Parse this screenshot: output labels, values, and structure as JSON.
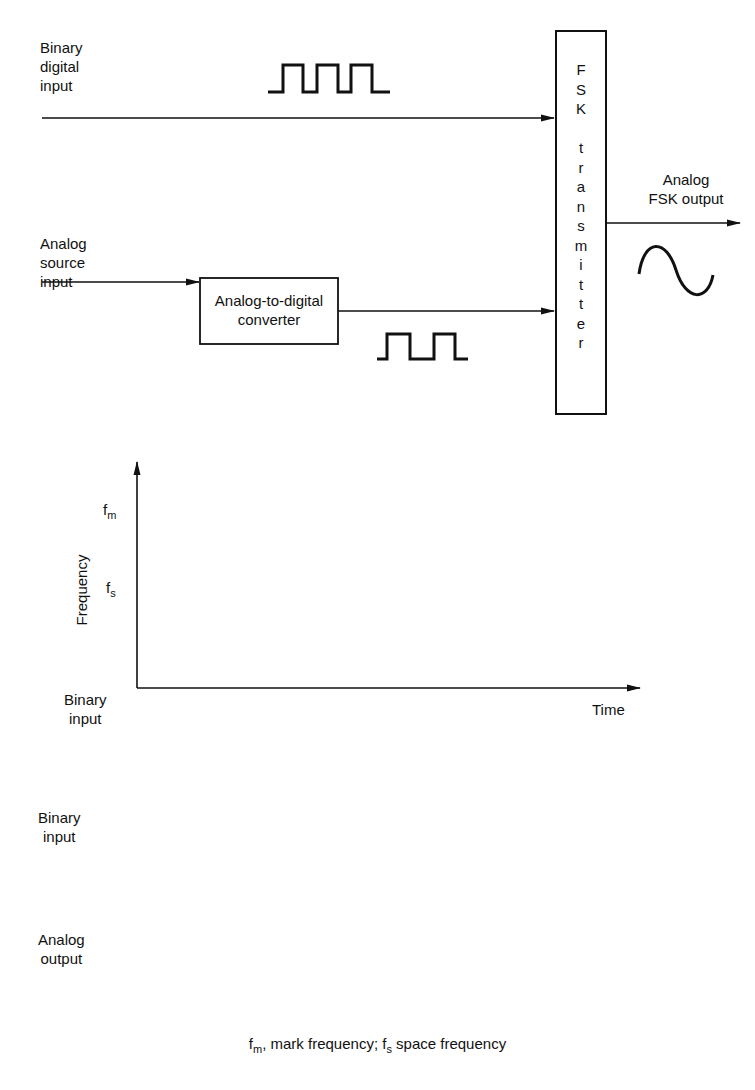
{
  "block_diagram": {
    "binary_input_label": "Binary\ndigital\ninput",
    "analog_input_label": "Analog\nsource\ninput",
    "adc_label": "Analog-to-digital\nconverter",
    "transmitter_label": "F\nS\nK\n\nt\nr\na\nn\ns\nm\ni\nt\nt\ne\nr",
    "output_label": "Analog\nFSK output"
  },
  "chart_data": [
    {
      "type": "line",
      "title": "",
      "xlabel": "Time",
      "ylabel": "Frequency",
      "y_ticks": [
        "fm",
        "fs"
      ],
      "x_row_label": "Binary\ninput",
      "categories": [
        "1",
        "0",
        "1",
        "0",
        "1",
        "0"
      ],
      "values": [
        "fm",
        "fs",
        "fm",
        "fs",
        "fm",
        "fs"
      ],
      "grid": false
    },
    {
      "type": "line",
      "title": "",
      "row_labels": [
        "Binary\ninput",
        "Analog\noutput"
      ],
      "binary_input": [
        "0",
        "1",
        "0",
        "1",
        "0",
        "1",
        "0",
        "1",
        "0",
        "1",
        "0"
      ],
      "analog_output": [
        "fs",
        "fm",
        "fs",
        "fm",
        "fs",
        "fm",
        "fs",
        "fm",
        "fs",
        "fm",
        "fs"
      ]
    }
  ],
  "chart1": {
    "fm_base": "f",
    "fm_sub": "m",
    "fs_base": "f",
    "fs_sub": "s",
    "ylabel": "Frequency",
    "xlabel": "Time",
    "row_label": "Binary\ninput",
    "bits": [
      "1",
      "0",
      "1",
      "0",
      "1",
      "0"
    ]
  },
  "chart2": {
    "binary_label": "Binary\ninput",
    "analog_label": "Analog\noutput",
    "bits": [
      "0",
      "1",
      "0",
      "1",
      "0",
      "1",
      "0",
      "1",
      "0",
      "1",
      "0"
    ],
    "freq_base": "f",
    "freq_subs": [
      "s",
      "m",
      "s",
      "m",
      "s",
      "m",
      "s",
      "m",
      "s",
      "m",
      "s"
    ]
  },
  "caption": {
    "fm_base": "f",
    "fm_sub": "m",
    "part1": ", mark frequency; ",
    "fs_base": "f",
    "fs_sub": "s",
    "part2": " space frequency"
  }
}
